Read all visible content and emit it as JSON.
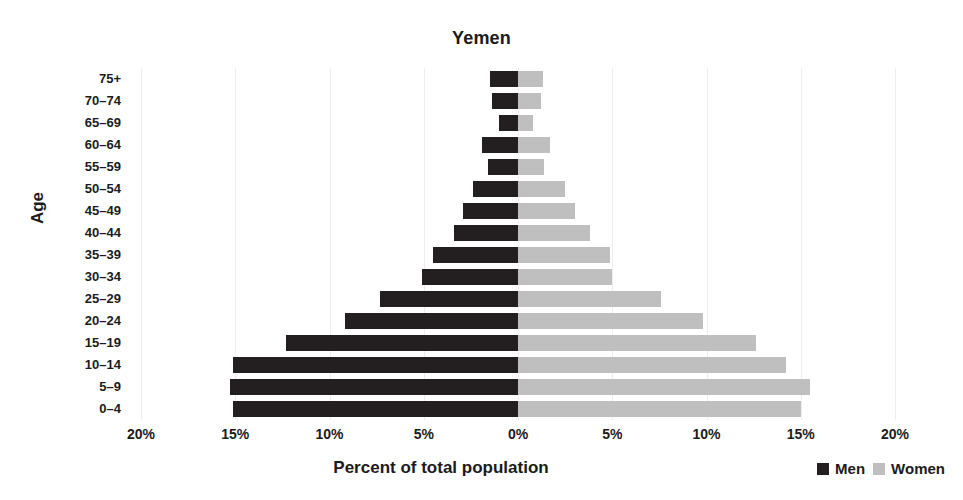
{
  "chart_data": {
    "type": "bar",
    "subtype": "population-pyramid",
    "title": "Yemen",
    "xlabel": "Percent of total population",
    "ylabel": "Age",
    "grid": true,
    "legend_position": "bottom-right",
    "xlim": [
      -20,
      20
    ],
    "xtick_labels": [
      "20%",
      "15%",
      "10%",
      "5%",
      "0%",
      "5%",
      "10%",
      "15%",
      "20%"
    ],
    "xtick_values": [
      -20,
      -15,
      -10,
      -5,
      0,
      5,
      10,
      15,
      20
    ],
    "categories": [
      "75+",
      "70–74",
      "65–69",
      "60–64",
      "55–59",
      "50–54",
      "45–49",
      "40–44",
      "35–39",
      "30–34",
      "25–29",
      "20–24",
      "15–19",
      "10–14",
      "5–9",
      "0–4"
    ],
    "series": [
      {
        "name": "Men",
        "color": "#231f20",
        "side": "left",
        "values": [
          1.5,
          1.4,
          1.0,
          1.9,
          1.6,
          2.4,
          2.9,
          3.4,
          4.5,
          5.1,
          7.3,
          9.2,
          12.3,
          15.1,
          15.3,
          15.1
        ]
      },
      {
        "name": "Women",
        "color": "#bfbfbf",
        "side": "right",
        "values": [
          1.3,
          1.2,
          0.8,
          1.7,
          1.4,
          2.5,
          3.0,
          3.8,
          4.9,
          5.0,
          7.6,
          9.8,
          12.6,
          14.2,
          15.5,
          15.0
        ]
      }
    ]
  },
  "legend": {
    "men_label": "Men",
    "women_label": "Women",
    "men_color": "#231f20",
    "women_color": "#bfbfbf"
  }
}
